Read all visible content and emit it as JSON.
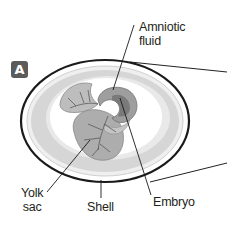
{
  "figure": {
    "panel_label": "A",
    "labels": {
      "amniotic_fluid_line1": "Amniotic",
      "amniotic_fluid_line2": "fluid",
      "yolk_sac_line1": "Yolk",
      "yolk_sac_line2": "sac",
      "shell": "Shell",
      "embryo": "Embryo"
    },
    "colors": {
      "shell_outline": "#1a1a1a",
      "albumen": "#d9d9d9",
      "membrane": "#f2f2f2",
      "inner_cavity": "#ffffff",
      "yolk_sac": "#a8a8a8",
      "vessels": "#555555",
      "badge": "#5b5b5b"
    }
  }
}
